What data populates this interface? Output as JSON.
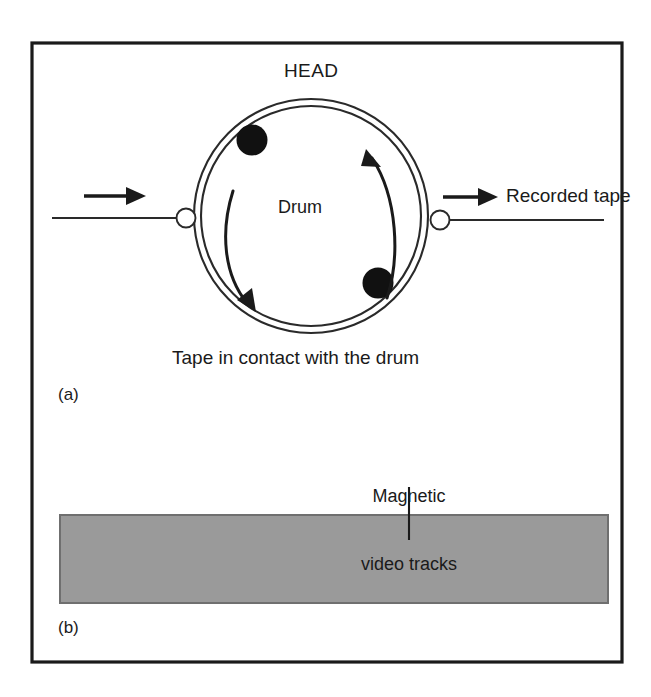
{
  "figure": {
    "type": "technical-diagram",
    "background_color": "#ffffff",
    "border_color": "#1a1a1a",
    "ink_color": "#1a1a1a"
  },
  "part_a": {
    "caption_label": "(a)",
    "head_label": "HEAD",
    "drum_label": "Drum",
    "recorded_tape_label": "Recorded tape",
    "tape_contact_label": "Tape in contact with the drum",
    "head_color": "#111111",
    "head_count": 2,
    "rotation_arrow_count": 2,
    "roller_count": 2,
    "tape_direction_arrow_count": 2
  },
  "part_b": {
    "caption_label": "(b)",
    "tracks_label_line1": "Magnetic",
    "tracks_label_line2": "video tracks",
    "tape_band_color": "#9a9a9a",
    "tape_band_border_color": "#6f6f6f"
  }
}
